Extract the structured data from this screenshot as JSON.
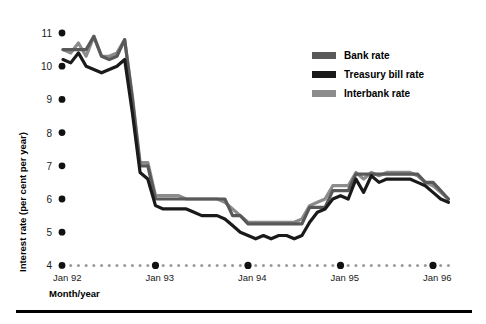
{
  "chart_data": {
    "type": "line",
    "title": "",
    "xlabel": "Month/year",
    "ylabel": "Interest rate (per cent per year)",
    "ylim": [
      4,
      11
    ],
    "yticks": [
      4,
      5,
      6,
      7,
      8,
      9,
      10,
      11
    ],
    "ytick_labels": [
      "4",
      "5",
      "6",
      "7",
      "8",
      "9",
      "10",
      "11"
    ],
    "grid": false,
    "legend_position": "top-right",
    "x_major_ticks": [
      "Jan 92",
      "Jan 93",
      "Jan 94",
      "Jan 95",
      "Jan 96"
    ],
    "x_major_indices": [
      0,
      12,
      24,
      36,
      48
    ],
    "x_minor_count": 51,
    "x": [
      "Jan 92",
      "Feb 92",
      "Mar 92",
      "Apr 92",
      "May 92",
      "Jun 92",
      "Jul 92",
      "Aug 92",
      "Sep 92",
      "Oct 92",
      "Nov 92",
      "Dec 92",
      "Jan 93",
      "Feb 93",
      "Mar 93",
      "Apr 93",
      "May 93",
      "Jun 93",
      "Jul 93",
      "Aug 93",
      "Sep 93",
      "Oct 93",
      "Nov 93",
      "Dec 93",
      "Jan 94",
      "Feb 94",
      "Mar 94",
      "Apr 94",
      "May 94",
      "Jun 94",
      "Jul 94",
      "Aug 94",
      "Sep 94",
      "Oct 94",
      "Nov 94",
      "Dec 94",
      "Jan 95",
      "Feb 95",
      "Mar 95",
      "Apr 95",
      "May 95",
      "Jun 95",
      "Jul 95",
      "Aug 95",
      "Sep 95",
      "Oct 95",
      "Nov 95",
      "Dec 95",
      "Jan 96",
      "Feb 96",
      "Mar 96"
    ],
    "series": [
      {
        "name": "Bank rate",
        "color": "#595959",
        "values": [
          10.5,
          10.5,
          10.5,
          10.5,
          10.9,
          10.3,
          10.2,
          10.3,
          10.8,
          9.0,
          7.0,
          7.0,
          6.0,
          6.0,
          6.0,
          6.0,
          6.0,
          6.0,
          6.0,
          6.0,
          6.0,
          6.0,
          5.5,
          5.5,
          5.25,
          5.25,
          5.25,
          5.25,
          5.25,
          5.25,
          5.25,
          5.25,
          5.75,
          5.75,
          5.75,
          6.25,
          6.25,
          6.25,
          6.75,
          6.75,
          6.75,
          6.75,
          6.75,
          6.75,
          6.75,
          6.75,
          6.75,
          6.5,
          6.5,
          6.25,
          6.0
        ]
      },
      {
        "name": "Treasury bill rate",
        "color": "#1a1a1a",
        "values": [
          10.2,
          10.1,
          10.4,
          10.0,
          9.9,
          9.8,
          9.9,
          10.0,
          10.2,
          8.6,
          6.8,
          6.6,
          5.8,
          5.7,
          5.7,
          5.7,
          5.7,
          5.6,
          5.5,
          5.5,
          5.5,
          5.4,
          5.2,
          5.0,
          4.9,
          4.8,
          4.9,
          4.8,
          4.9,
          4.9,
          4.8,
          4.9,
          5.3,
          5.6,
          5.7,
          6.0,
          6.1,
          6.0,
          6.6,
          6.2,
          6.7,
          6.5,
          6.6,
          6.6,
          6.6,
          6.6,
          6.5,
          6.4,
          6.2,
          6.0,
          5.9
        ]
      },
      {
        "name": "Interbank rate",
        "color": "#8c8c8c",
        "values": [
          10.5,
          10.4,
          10.7,
          10.3,
          10.9,
          10.3,
          10.3,
          10.4,
          10.8,
          9.1,
          7.1,
          7.1,
          6.1,
          6.1,
          6.1,
          6.1,
          6.0,
          6.0,
          6.0,
          6.0,
          6.0,
          5.9,
          5.7,
          5.5,
          5.3,
          5.3,
          5.3,
          5.3,
          5.3,
          5.3,
          5.3,
          5.4,
          5.8,
          5.9,
          6.0,
          6.4,
          6.4,
          6.4,
          6.8,
          6.6,
          6.8,
          6.7,
          6.8,
          6.8,
          6.8,
          6.8,
          6.7,
          6.5,
          6.4,
          6.2,
          6.0
        ]
      }
    ]
  },
  "legend": {
    "items": [
      {
        "label": "Bank rate",
        "color": "#595959"
      },
      {
        "label": "Treasury bill rate",
        "color": "#1a1a1a"
      },
      {
        "label": "Interbank rate",
        "color": "#8c8c8c"
      }
    ]
  },
  "axes": {
    "y_title": "Interest rate (per cent per year)",
    "x_title": "Month/year",
    "ytick_labels": [
      "11",
      "10",
      "9",
      "8",
      "7",
      "6",
      "5",
      "4"
    ],
    "xtick_labels": [
      "Jan 92",
      "Jan 93",
      "Jan 94",
      "Jan 95",
      "Jan 96"
    ]
  }
}
